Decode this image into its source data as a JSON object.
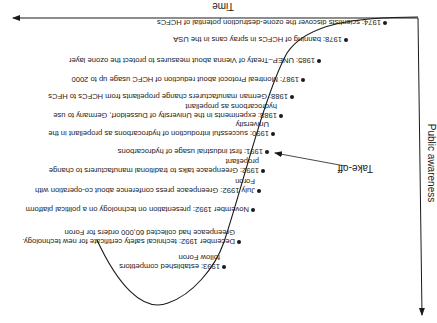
{
  "axes": {
    "x_label": "Time",
    "y_label": "Public awareness"
  },
  "annotation": {
    "take_off_label": "Take-off"
  },
  "events": [
    {
      "lines": [
        "1974: scientists discover the ozone-destruction potential of HCFCs"
      ]
    },
    {
      "lines": [
        "1978: banning of HCFCs in spray cans in the USA"
      ]
    },
    {
      "lines": [
        "1985: UNEP–Treaty of Vienna about measures to protect the ozone layer"
      ]
    },
    {
      "lines": [
        "1987: Montreal Protocol about reduction of HCFC usage up to 2000"
      ]
    },
    {
      "lines": [
        "1988: German manufacturers change propellants from HCFCs to HFCs"
      ]
    },
    {
      "lines": [
        "1988: experiments in the University of Dusseldorf, Germany to use",
        "hydrocarbons as propellant"
      ]
    },
    {
      "lines": [
        "1990: successful introduction of hydrocarbons as propellant in the",
        "University"
      ]
    },
    {
      "lines": [
        "1991: first industrial usage of hydrocarbons"
      ]
    },
    {
      "lines": [
        "1992: Greenpeace talks to traditional manufacturers to change",
        "propellant"
      ]
    },
    {
      "lines": [
        "July 1992: Greenpeace press conference about co-operation with",
        "Foron"
      ]
    },
    {
      "lines": [
        "November 1992: presentation on technology on a political platform"
      ]
    },
    {
      "lines": [
        "December 1992: technical safety certificate for new technology.",
        "Greenpeace had collected 60,000 orders for Foron"
      ]
    },
    {
      "lines": [
        "1993: established competitors",
        "follow Foron"
      ]
    }
  ]
}
